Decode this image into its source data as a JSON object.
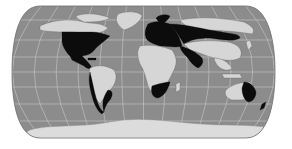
{
  "map": {
    "projection": "pseudo-cylindrical world map",
    "colors": {
      "ocean": "#8c8c8c",
      "graticule": "#d4d4d4",
      "highlighted_land": "#0c0c0c",
      "other_land": "#d6d6d6",
      "background": "#ffffff"
    },
    "legend": [],
    "labels": [],
    "highlighted_regions": [
      "Eastern United States",
      "Central America",
      "Western / Southern South America",
      "Europe",
      "Northern Russia / Siberia",
      "Central Asia",
      "Southern Africa",
      "Eastern Australia"
    ]
  }
}
